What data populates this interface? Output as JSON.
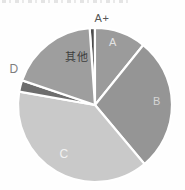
{
  "chart_data": {
    "type": "pie",
    "title": "",
    "legend": "none",
    "grid": false,
    "start_angle_deg": -4,
    "rotation": "clockwise",
    "gap_color": "#ffffff",
    "background_color": "#fefefe",
    "slices": [
      {
        "label": "A+",
        "value": 1.1,
        "color": "#4d4d4d",
        "label_color": "#565656",
        "label_position": "outside"
      },
      {
        "label": "A",
        "value": 10.8,
        "color": "#9b9b9b",
        "label_color": "#e3e3e3",
        "label_position": "inside"
      },
      {
        "label": "B",
        "value": 28.1,
        "color": "#959595",
        "label_color": "#d6d6d6",
        "label_position": "inside"
      },
      {
        "label": "C",
        "value": 38.9,
        "color": "#c9c9c9",
        "label_color": "#f2f2f2",
        "label_position": "inside"
      },
      {
        "label": "D",
        "value": 2.4,
        "color": "#6d6d6d",
        "label_color": "#7e7e7e",
        "label_position": "outside"
      },
      {
        "label": "其他",
        "value": 18.7,
        "color": "#9e9e9e",
        "label_color": "#3d3d3d",
        "label_position": "inside"
      }
    ],
    "unit": "percent",
    "center": {
      "x": 95,
      "y": 105
    },
    "radius": 77
  }
}
